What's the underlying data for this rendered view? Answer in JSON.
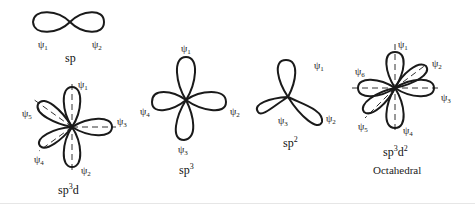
{
  "figure": {
    "diagrams": [
      {
        "id": "sp",
        "caption": "sp",
        "caption_base": "sp",
        "caption_sup": "",
        "caption_tail": "",
        "labels": [
          "ψ1",
          "ψ2"
        ]
      },
      {
        "id": "sp3d",
        "caption": "sp3d",
        "caption_base": "sp",
        "caption_sup": "3",
        "caption_tail": "d",
        "labels": [
          "ψ1",
          "ψ2",
          "ψ3",
          "ψ4",
          "ψ5"
        ]
      },
      {
        "id": "sp3",
        "caption": "sp3",
        "caption_base": "sp",
        "caption_sup": "3",
        "caption_tail": "",
        "labels": [
          "ψ1",
          "ψ2",
          "ψ3",
          "ψ4"
        ]
      },
      {
        "id": "sp2",
        "caption": "sp2",
        "caption_base": "sp",
        "caption_sup": "2",
        "caption_tail": "",
        "labels": [
          "ψ1",
          "ψ2",
          "ψ3"
        ]
      },
      {
        "id": "sp3d2",
        "caption": "sp3d2",
        "caption_base": "sp",
        "caption_sup": "3",
        "caption_mid": "d",
        "caption_sup2": "2",
        "subtitle": "Octahedral",
        "labels": [
          "ψ1",
          "ψ2",
          "ψ3",
          "ψ4",
          "ψ5",
          "ψ6"
        ]
      }
    ],
    "psi": "ψ",
    "subscripts": [
      "1",
      "2",
      "3",
      "4",
      "5",
      "6"
    ]
  }
}
